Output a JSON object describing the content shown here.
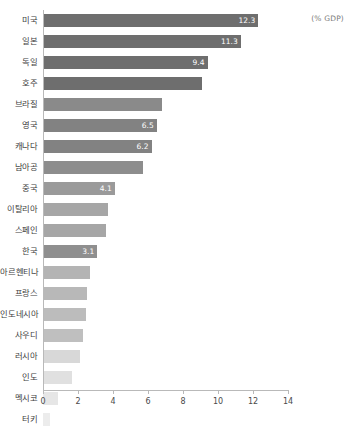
{
  "annotation": {
    "unit_note": "(% GDP)"
  },
  "chart_data": {
    "type": "bar",
    "orientation": "horizontal",
    "title": "",
    "subtitle": "",
    "xlabel": "",
    "ylabel": "",
    "unit_label": "(% GDP)",
    "xlim": [
      0,
      14
    ],
    "xticks": [
      0,
      2,
      4,
      6,
      8,
      10,
      12,
      14
    ],
    "xtick_labels": [
      "0",
      "2",
      "4",
      "6",
      "8",
      "10",
      "12",
      "14"
    ],
    "grid": false,
    "legend": null,
    "categories": [
      "미국",
      "일본",
      "독일",
      "호주",
      "브라질",
      "영국",
      "캐나다",
      "남아공",
      "중국",
      "이탈리아",
      "스페인",
      "한국",
      "아르헨티나",
      "프랑스",
      "인도네시아",
      "사우디",
      "러시아",
      "인도",
      "멕시코",
      "터키"
    ],
    "values": [
      12.3,
      11.3,
      9.4,
      9.1,
      6.8,
      6.5,
      6.2,
      5.7,
      4.1,
      3.7,
      3.6,
      3.1,
      2.7,
      2.5,
      2.45,
      2.3,
      2.1,
      1.65,
      0.85,
      0.4
    ],
    "data_labels": [
      "12.3",
      "11.3",
      "9.4",
      "",
      "",
      "6.5",
      "6.2",
      "",
      "4.1",
      "",
      "",
      "3.1",
      "",
      "",
      "",
      "",
      "",
      "",
      "",
      ""
    ],
    "bar_colors": [
      "#6e6e6e",
      "#6e6e6e",
      "#6e6e6e",
      "#6e6e6e",
      "#8a8a8a",
      "#828282",
      "#828282",
      "#8d8d8d",
      "#9a9a9a",
      "#a6a6a6",
      "#a6a6a6",
      "#8f8f8f",
      "#b4b4b4",
      "#b8b8b8",
      "#bcbcbc",
      "#bfbfbf",
      "#d8d8d8",
      "#e0e0e0",
      "#e6e6e6",
      "#ececec"
    ]
  }
}
